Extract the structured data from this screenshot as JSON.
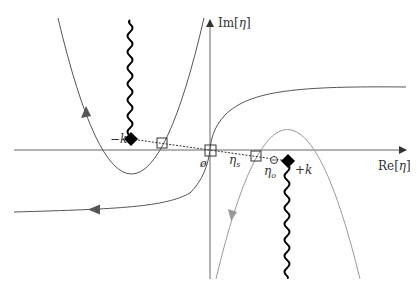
{
  "diagram": {
    "axes": {
      "x_label_prefix": "Re[",
      "x_label_var": "η",
      "x_label_suffix": "]",
      "y_label_prefix": "Im[",
      "y_label_var": "η",
      "y_label_suffix": "]"
    },
    "points": {
      "minus_k": {
        "label": "−k",
        "shape": "diamond"
      },
      "plus_k": {
        "label": "+k",
        "shape": "diamond"
      },
      "origin": {
        "label": "ø",
        "shape": "square"
      },
      "eta_s": {
        "label_main": "η",
        "label_sub": "s",
        "shape": "square"
      },
      "eta_o": {
        "label_main": "η",
        "label_sub": "o",
        "shape": "circle"
      },
      "left_crossing": {
        "shape": "square"
      }
    },
    "curves": [
      {
        "name": "left-parabola",
        "color": "#555555",
        "direction": "up"
      },
      {
        "name": "hyperbola-curve",
        "color": "#555555",
        "direction": "left"
      },
      {
        "name": "right-parabola",
        "color": "#9a9a9a",
        "direction": "down"
      }
    ],
    "branch_cuts": [
      {
        "from": "minus_k",
        "direction": "up"
      },
      {
        "from": "plus_k",
        "direction": "down"
      }
    ],
    "colors": {
      "axis": "#666666",
      "dark_curve": "#555555",
      "light_curve": "#9a9a9a",
      "marker": "#000000",
      "dotted_line": "#333333"
    }
  }
}
